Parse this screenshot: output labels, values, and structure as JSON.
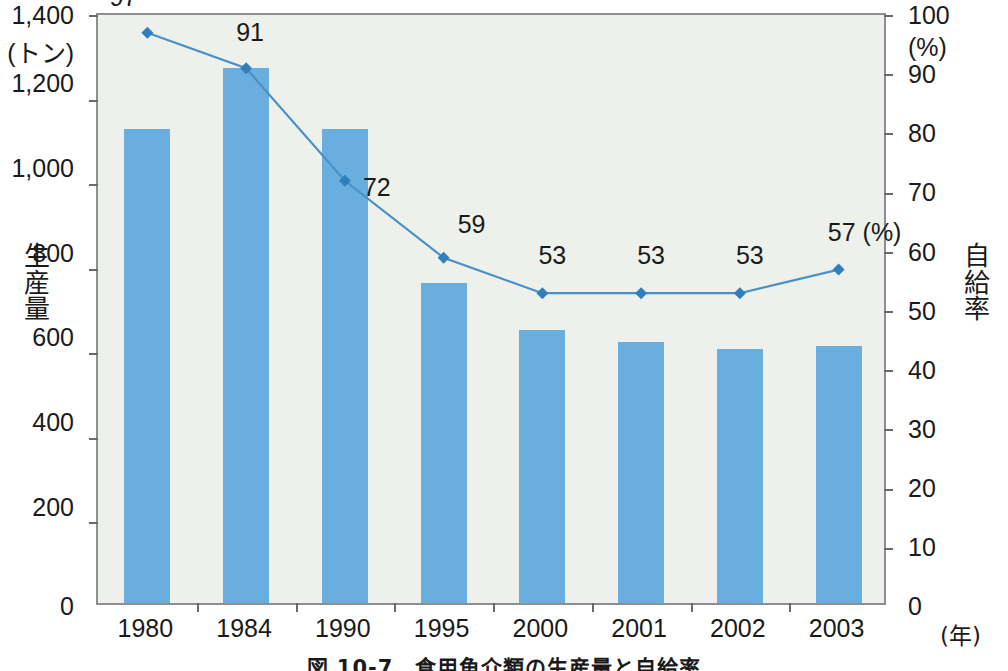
{
  "chart_data": {
    "type": "bar",
    "title": "図 10-7　食用魚介類の生産量と自給率",
    "categories": [
      "1980",
      "1984",
      "1990",
      "1995",
      "2000",
      "2001",
      "2002",
      "2003"
    ],
    "xlabel": "(年)",
    "ylabel": "生産量",
    "y_unit": "(トン)",
    "ylim": [
      0,
      1400
    ],
    "yticks": [
      "0",
      "200",
      "400",
      "600",
      "800",
      "1,000",
      "1,200",
      "1,400"
    ],
    "y2label": "自給率",
    "y2_unit": "(%)",
    "y2lim": [
      0,
      100
    ],
    "y2ticks": [
      "0",
      "10",
      "20",
      "30",
      "40",
      "50",
      "60",
      "70",
      "80",
      "90",
      "100"
    ],
    "grid": false,
    "legend": "none",
    "series": [
      {
        "name": "生産量",
        "type": "bar",
        "axis": "left",
        "unit": "トン",
        "color": "#6aaee0",
        "values": [
          1120,
          1265,
          1120,
          757,
          645,
          617,
          600,
          608
        ]
      },
      {
        "name": "自給率",
        "type": "line",
        "axis": "right",
        "unit": "%",
        "color": "#4a90c8",
        "marker": "diamond",
        "values": [
          97,
          91,
          72,
          59,
          53,
          53,
          53,
          57
        ],
        "data_labels": [
          "97",
          "91",
          "72",
          "59",
          "53",
          "53",
          "53",
          "57 (%)"
        ]
      }
    ]
  },
  "axes": {
    "left_title": [
      "生",
      "産",
      "量"
    ],
    "right_title": [
      "自",
      "給",
      "率"
    ]
  }
}
